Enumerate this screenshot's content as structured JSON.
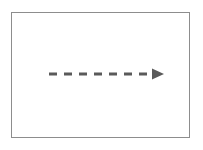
{
  "figure": {
    "title": "",
    "caption": "",
    "background_color": "#ffffff",
    "border_color": "#8d8d8d",
    "border_width_px": 1,
    "frame": {
      "x": 11,
      "y": 12,
      "width": 179,
      "height": 126
    }
  },
  "arrow": {
    "label": "",
    "icon": "dashed-arrow-right-icon",
    "color": "#5a5a5a",
    "direction": "right",
    "line_style": "dashed",
    "stroke_width_px": 3,
    "dash_length_px": 8,
    "dash_gap_px": 7,
    "dash_count": 8,
    "start_x": 37,
    "end_x": 141,
    "tip_x": 152,
    "y": 61,
    "head_width_px": 13,
    "head_height_px": 11
  },
  "chart_data": {
    "type": "diagram",
    "title": "",
    "elements": [
      {
        "kind": "rectangle",
        "role": "outer-frame",
        "fill": "#ffffff",
        "stroke": "#8d8d8d",
        "x": 11,
        "y": 12,
        "width": 179,
        "height": 126
      },
      {
        "kind": "arrow",
        "role": "dashed-arrow",
        "stroke": "#5a5a5a",
        "style": "dashed",
        "from": [
          48,
          73
        ],
        "to": [
          163,
          73
        ],
        "points_to": "right"
      }
    ]
  }
}
